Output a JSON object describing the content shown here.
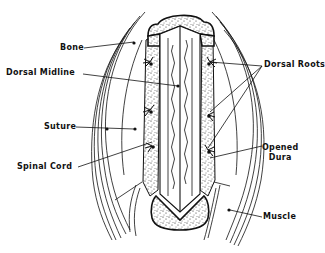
{
  "figure": {
    "type": "anatomical-line-drawing",
    "ink_color": "#111111",
    "background": "#ffffff"
  },
  "labels": {
    "bone": "Bone",
    "dorsal_midline": "Dorsal Midline",
    "suture": "Suture",
    "spinal_cord": "Spinal Cord",
    "dorsal_roots": "Dorsal Roots",
    "opened_dura_line1": "Opened",
    "opened_dura_line2": "Dura",
    "muscle": "Muscle"
  }
}
